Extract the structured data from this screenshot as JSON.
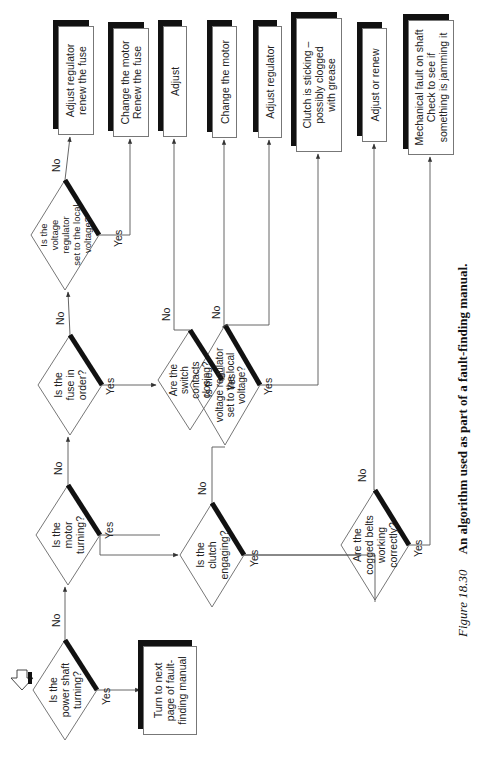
{
  "figure": {
    "number": "Figure 18.30",
    "title": "An algorithm used as part of a fault-finding manual.",
    "orientation": "rotated 90° counter-clockwise"
  },
  "start_icon": "start-arrow-icon",
  "decisions": [
    {
      "id": "d1",
      "text": "Is the\npower shaft\nturning?",
      "yes": "Turn to next page of fault-finding manual",
      "no": "d2"
    },
    {
      "id": "d2",
      "text": "Is the\nmotor\nturning?",
      "yes": "d5",
      "no": "d3"
    },
    {
      "id": "d3",
      "text": "Is the\nfuse in\norder?",
      "yes": "d6",
      "no": "d4"
    },
    {
      "id": "d4",
      "text": "Is the\nvoltage\nregulator\nset to the local\nvoltage?",
      "yes": "Change the motor / Renew the fuse",
      "no": "Adjust regulator / renew the fuse"
    },
    {
      "id": "d5",
      "text": "Is the\nclutch\nengaging?",
      "yes": "d8",
      "no": "d7"
    },
    {
      "id": "d6",
      "text": "Are the\nswitch\ncontacts\nclosing?",
      "yes": "Change the motor",
      "no": "Adjust"
    },
    {
      "id": "d7",
      "text": "Is the\nvoltage regulator\nset to the local\nvoltage?",
      "yes": "Clutch is sticking – possibly clogged with grease",
      "no": "Adjust regulator"
    },
    {
      "id": "d8",
      "text": "Are the\ncogged belts\nworking\ncorrectly?",
      "yes": "Mechanical fault on shaft / Check to see if something is jamming it",
      "no": "Adjust or renew"
    }
  ],
  "outcomes": [
    {
      "id": "o0",
      "text": "Turn to next\npage of fault-\nfinding manual"
    },
    {
      "id": "o1",
      "text": "Adjust regulator\nrenew the fuse"
    },
    {
      "id": "o2",
      "text": "Change the motor\nRenew the fuse"
    },
    {
      "id": "o3",
      "text": "Adjust"
    },
    {
      "id": "o4",
      "text": "Change the motor"
    },
    {
      "id": "o5",
      "text": "Adjust  regulator"
    },
    {
      "id": "o6",
      "text": "Clutch is sticking –\npossibly clogged\nwith grease"
    },
    {
      "id": "o7",
      "text": "Adjust or renew"
    },
    {
      "id": "o8",
      "text": "Mechanical fault on shaft\nCheck to see if\nsomething is jamming it"
    }
  ],
  "labels": {
    "yes": "Yes",
    "no": "No"
  },
  "colors": {
    "line": "#555555",
    "shadow": "#111111",
    "text": "#222222",
    "background": "#ffffff"
  }
}
